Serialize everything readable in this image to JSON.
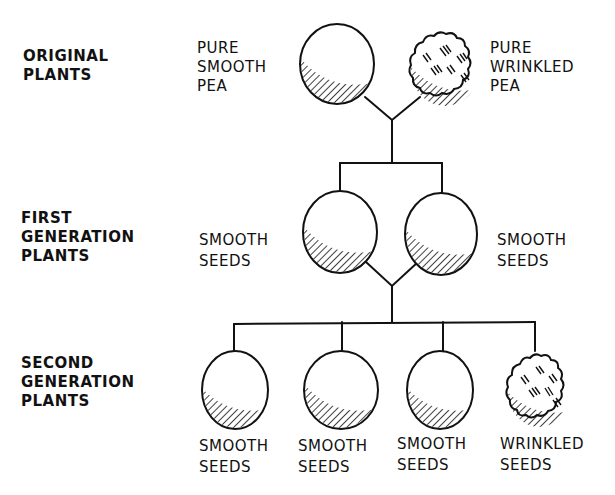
{
  "generations": [
    {
      "label_lines": [
        "ORIGINAL",
        "PLANTS"
      ]
    },
    {
      "label_lines": [
        "FIRST",
        "GENERATION",
        "PLANTS"
      ]
    },
    {
      "label_lines": [
        "SECOND",
        "GENERATION",
        "PLANTS"
      ]
    }
  ],
  "original": {
    "left": {
      "lines": [
        "PURE",
        "SMOOTH",
        "PEA"
      ],
      "type": "smooth"
    },
    "right": {
      "lines": [
        "PURE",
        "WRINKLED",
        "PEA"
      ],
      "type": "wrinkled"
    }
  },
  "first": {
    "left": {
      "lines": [
        "SMOOTH",
        "SEEDS"
      ],
      "type": "smooth"
    },
    "right": {
      "lines": [
        "SMOOTH",
        "SEEDS"
      ],
      "type": "smooth"
    }
  },
  "second": [
    {
      "lines": [
        "SMOOTH",
        "SEEDS"
      ],
      "type": "smooth"
    },
    {
      "lines": [
        "SMOOTH",
        "SEEDS"
      ],
      "type": "smooth"
    },
    {
      "lines": [
        "SMOOTH",
        "SEEDS"
      ],
      "type": "smooth"
    },
    {
      "lines": [
        "WRINKLED",
        "SEEDS"
      ],
      "type": "wrinkled"
    }
  ],
  "colors": {
    "ink": "#111111",
    "background": "#ffffff"
  }
}
